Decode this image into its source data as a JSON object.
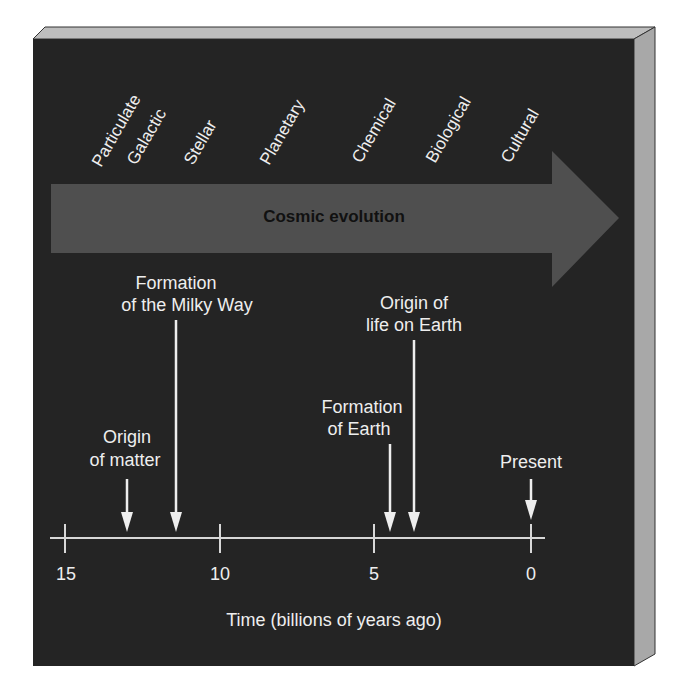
{
  "diagram": {
    "title": "Cosmic evolution",
    "colors": {
      "panel_front": "#242424",
      "panel_top": "#bdbdbd",
      "panel_side": "#a8a8a8",
      "arrow_fill": "#4f4f4f",
      "arrow_text": "#111111",
      "foreground": "#eeeeee"
    },
    "eras": [
      {
        "label": "Particulate"
      },
      {
        "label": "Galactic"
      },
      {
        "label": "Stellar"
      },
      {
        "label": "Planetary"
      },
      {
        "label": "Chemical"
      },
      {
        "label": "Biological"
      },
      {
        "label": "Cultural"
      }
    ],
    "events": [
      {
        "line1": "Origin",
        "line2": "of matter",
        "time_gya": 13
      },
      {
        "line1": "Formation",
        "line2": "of the Milky Way",
        "time_gya": 11.4
      },
      {
        "line1": "Formation",
        "line2": "of Earth",
        "time_gya": 4.5
      },
      {
        "line1": "Origin of",
        "line2": "life on Earth",
        "time_gya": 3.8
      },
      {
        "line1": "Present",
        "line2": "",
        "time_gya": 0
      }
    ],
    "axis": {
      "ticks": [
        "15",
        "10",
        "5",
        "0"
      ],
      "label": "Time (billions of years ago)"
    }
  }
}
